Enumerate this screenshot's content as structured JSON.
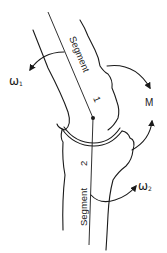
{
  "diagram": {
    "type": "biomechanics-two-segment-joint",
    "labels": {
      "segment1": "Segment",
      "segment1_number": "1",
      "segment2": "Segment",
      "segment2_number": "2",
      "omega1_symbol": "ω",
      "omega1_subscript": "1",
      "omega2_symbol": "ω",
      "omega2_subscript": "2",
      "moment": "M"
    },
    "colors": {
      "ink": "#1a1a1a",
      "background": "#ffffff"
    }
  }
}
